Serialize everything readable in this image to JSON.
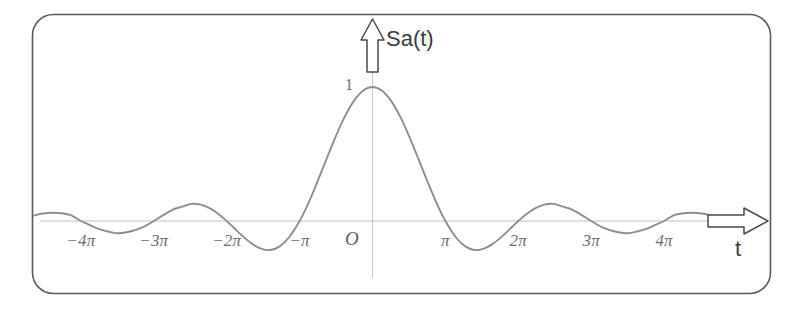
{
  "figure": {
    "kind": "math-plot",
    "border_color": "#5a5a5a",
    "curve_color": "#8e8e8e",
    "axis_color": "#b9b9b9",
    "label_color": "#6d6d6d",
    "background": "#ffffff"
  },
  "labels": {
    "y_axis": "Sa(t)",
    "x_axis": "t",
    "origin": "O",
    "peak_value": "1"
  },
  "icons": {
    "y_arrow": "up-block-arrow-icon",
    "x_arrow": "right-block-arrow-icon"
  },
  "chart_data": {
    "type": "line",
    "title": "",
    "subtitle": "",
    "xlabel": "t",
    "ylabel": "Sa(t)",
    "function": "Sa(t) = sin(t)/t",
    "grid": false,
    "legend": null,
    "xlim": [
      -14.6,
      14.6
    ],
    "ylim": [
      -0.3,
      1.15
    ],
    "x_tick_labels": [
      "−4π",
      "−3π",
      "−2π",
      "−π",
      "π",
      "2π",
      "3π",
      "4π"
    ],
    "x_tick_values": [
      -12.566,
      -9.425,
      -6.283,
      -3.142,
      3.142,
      6.283,
      9.425,
      12.566
    ],
    "y_tick_labels": [
      "1"
    ],
    "y_tick_values": [
      1
    ],
    "annotations": [
      {
        "text": "O",
        "x": 0,
        "y": 0,
        "role": "origin"
      },
      {
        "text": "1",
        "x": 0,
        "y": 1,
        "role": "peak-value"
      }
    ],
    "series": [
      {
        "name": "Sa(t)",
        "x": [
          -14.6,
          -14.2,
          -13.8,
          -13.4,
          -13.0,
          -12.566,
          -12.2,
          -11.8,
          -11.4,
          -11.0,
          -10.6,
          -10.2,
          -9.8,
          -9.425,
          -9.0,
          -8.6,
          -8.2,
          -7.8,
          -7.4,
          -7.0,
          -6.6,
          -6.283,
          -6.0,
          -5.6,
          -5.2,
          -4.8,
          -4.4,
          -4.0,
          -3.6,
          -3.142,
          -2.8,
          -2.4,
          -2.0,
          -1.6,
          -1.2,
          -0.8,
          -0.4,
          0.0,
          0.4,
          0.8,
          1.2,
          1.6,
          2.0,
          2.4,
          2.8,
          3.142,
          3.6,
          4.0,
          4.4,
          4.8,
          5.2,
          5.6,
          6.0,
          6.283,
          6.6,
          7.0,
          7.4,
          7.8,
          8.2,
          8.6,
          9.0,
          9.425,
          9.8,
          10.2,
          10.6,
          11.0,
          11.4,
          11.8,
          12.2,
          12.566,
          13.0,
          13.4,
          13.8,
          14.2,
          14.6
        ],
        "y": [
          0.0406,
          0.0556,
          0.0616,
          0.0577,
          0.0443,
          0.0,
          -0.0289,
          -0.0595,
          -0.0784,
          -0.0909,
          -0.0836,
          -0.0657,
          -0.0375,
          0.0,
          0.0457,
          0.0856,
          0.1069,
          0.1278,
          0.1222,
          0.0939,
          0.047,
          0.0,
          -0.0466,
          -0.1124,
          -0.169,
          -0.2059,
          -0.2169,
          -0.1892,
          -0.1232,
          0.0,
          0.1199,
          0.2816,
          0.4546,
          0.6247,
          0.7767,
          0.8967,
          0.9735,
          1.0,
          0.9735,
          0.8967,
          0.7767,
          0.6247,
          0.4546,
          0.2816,
          0.1199,
          0.0,
          -0.1232,
          -0.1892,
          -0.2169,
          -0.2059,
          -0.169,
          -0.1124,
          -0.0466,
          0.0,
          0.047,
          0.0939,
          0.1222,
          0.1278,
          0.1069,
          0.0856,
          0.0457,
          0.0,
          -0.0375,
          -0.0657,
          -0.0836,
          -0.0909,
          -0.0784,
          -0.0595,
          -0.0289,
          0.0,
          0.0443,
          0.0577,
          0.0616,
          0.0556,
          0.0406
        ]
      }
    ]
  }
}
